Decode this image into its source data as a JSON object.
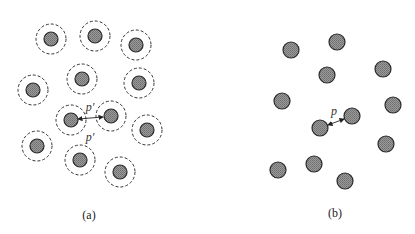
{
  "colors": {
    "particle_fill": "#8a8a8a",
    "particle_stroke": "#2a2a2a",
    "halo_stroke": "#333333",
    "background": "#ffffff"
  },
  "panels": [
    {
      "id": "a",
      "caption": "(a)",
      "caption_pos": [
        89,
        215
      ],
      "has_halos": true,
      "particle_radius": 7,
      "halo_radius": 15,
      "particles": [
        [
          51,
          39
        ],
        [
          95,
          36
        ],
        [
          136,
          45
        ],
        [
          82,
          79
        ],
        [
          139,
          83
        ],
        [
          33,
          90
        ],
        [
          71,
          120
        ],
        [
          111,
          116
        ],
        [
          147,
          130
        ],
        [
          37,
          146
        ],
        [
          80,
          160
        ],
        [
          120,
          172
        ]
      ],
      "arrows": [
        {
          "from": [
            78,
            119
          ],
          "to": [
            103,
            117
          ]
        }
      ],
      "distance_labels": [
        {
          "text": "p'",
          "pos": [
            90,
            107
          ]
        },
        {
          "text": "p'",
          "pos": [
            90,
            137
          ]
        }
      ]
    },
    {
      "id": "b",
      "caption": "(b)",
      "caption_pos": [
        335,
        213
      ],
      "has_halos": false,
      "particle_radius": 8,
      "particles": [
        [
          291,
          50
        ],
        [
          337,
          42
        ],
        [
          327,
          75
        ],
        [
          383,
          69
        ],
        [
          282,
          101
        ],
        [
          393,
          105
        ],
        [
          352,
          116
        ],
        [
          320,
          128
        ],
        [
          386,
          144
        ],
        [
          278,
          170
        ],
        [
          314,
          164
        ],
        [
          345,
          181
        ]
      ],
      "arrows": [
        {
          "from": [
            328,
            125
          ],
          "to": [
            344,
            119
          ]
        }
      ],
      "distance_labels": [
        {
          "text": "p",
          "pos": [
            334,
            111
          ]
        }
      ]
    }
  ]
}
